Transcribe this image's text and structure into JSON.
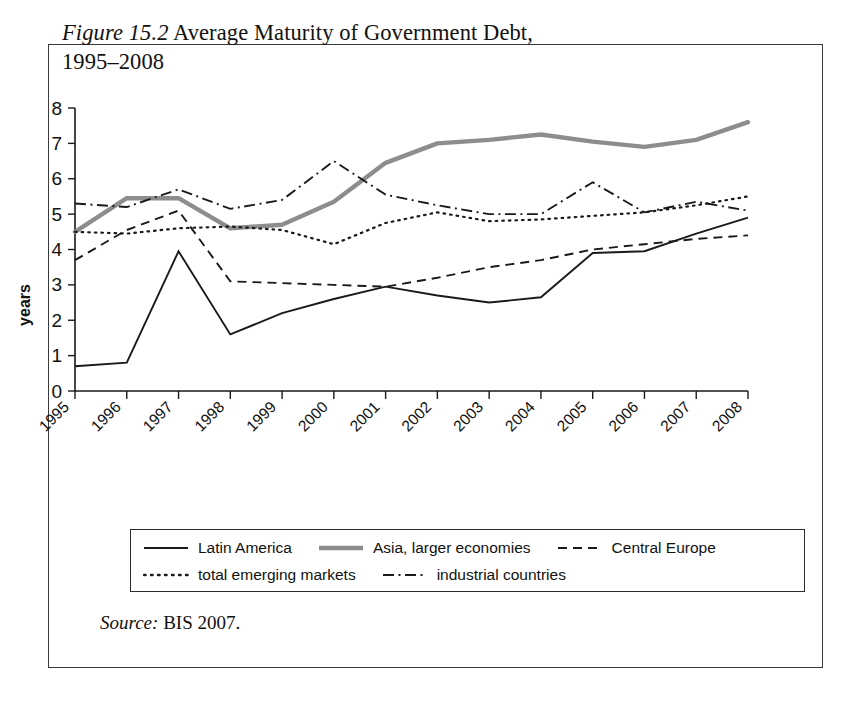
{
  "figure": {
    "number_label": "Figure 15.2",
    "title_rest": " Average Maturity of Government Debt,",
    "title_line2": "1995–2008",
    "source_word": "Source:",
    "source_rest": " BIS 2007."
  },
  "colors": {
    "axis": "#1a1a1a",
    "frame": "#3a3a3a",
    "asia_gray": "#8d8d8d",
    "background": "#ffffff"
  },
  "legend": {
    "entries": [
      {
        "label": "Latin America",
        "style": "solid-black"
      },
      {
        "label": "Asia, larger economies",
        "style": "solid-gray-thick"
      },
      {
        "label": "Central Europe",
        "style": "dashed"
      },
      {
        "label": "total emerging markets",
        "style": "dotted"
      },
      {
        "label": "industrial countries",
        "style": "dash-dot"
      }
    ]
  },
  "chart_data": {
    "type": "line",
    "title": "Figure 15.2 Average Maturity of Government Debt, 1995–2008",
    "xlabel": "",
    "ylabel": "years",
    "xlim": [
      1995,
      2008
    ],
    "ylim": [
      0,
      8
    ],
    "yticks": [
      0,
      1,
      2,
      3,
      4,
      5,
      6,
      7,
      8
    ],
    "grid": false,
    "legend_position": "bottom",
    "source": "BIS 2007.",
    "x": [
      1995,
      1996,
      1997,
      1998,
      1999,
      2000,
      2001,
      2002,
      2003,
      2004,
      2005,
      2006,
      2007,
      2008
    ],
    "categories": [
      "1995",
      "1996",
      "1997",
      "1998",
      "1999",
      "2000",
      "2001",
      "2002",
      "2003",
      "2004",
      "2005",
      "2006",
      "2007",
      "2008"
    ],
    "series": [
      {
        "name": "Latin America",
        "style": "solid-black",
        "values": [
          0.7,
          0.8,
          3.95,
          1.6,
          2.2,
          2.6,
          2.95,
          2.7,
          2.5,
          2.65,
          3.9,
          3.95,
          4.45,
          4.9
        ]
      },
      {
        "name": "Asia, larger economies",
        "style": "solid-gray-thick",
        "values": [
          4.5,
          5.45,
          5.45,
          4.6,
          4.7,
          5.35,
          6.45,
          7.0,
          7.1,
          7.25,
          7.05,
          6.9,
          7.1,
          7.6
        ]
      },
      {
        "name": "Central Europe",
        "style": "dashed",
        "values": [
          3.7,
          4.55,
          5.1,
          3.1,
          3.05,
          3.0,
          2.95,
          3.2,
          3.5,
          3.7,
          4.0,
          4.15,
          4.3,
          4.4
        ]
      },
      {
        "name": "total emerging markets",
        "style": "dotted",
        "values": [
          4.5,
          4.45,
          4.6,
          4.65,
          4.55,
          4.15,
          4.75,
          5.05,
          4.8,
          4.85,
          4.95,
          5.05,
          5.25,
          5.5
        ]
      },
      {
        "name": "industrial countries",
        "style": "dash-dot",
        "values": [
          5.3,
          5.2,
          5.7,
          5.15,
          5.4,
          6.5,
          5.55,
          5.25,
          5.0,
          5.0,
          5.9,
          5.05,
          5.35,
          5.1
        ]
      }
    ]
  }
}
